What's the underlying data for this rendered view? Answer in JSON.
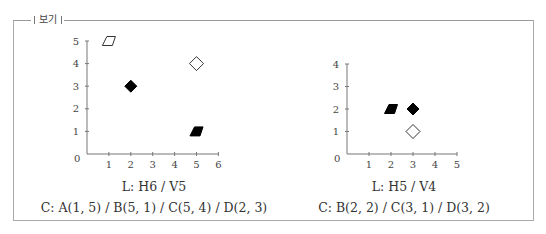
{
  "header": {
    "legend_label": "보기"
  },
  "chart_data": [
    {
      "type": "scatter",
      "title": "",
      "xlabel": "",
      "ylabel": "",
      "xlim": [
        0,
        6
      ],
      "ylim": [
        0,
        5
      ],
      "x_ticks": [
        "1",
        "2",
        "3",
        "4",
        "5",
        "6"
      ],
      "y_ticks": [
        "1",
        "2",
        "3",
        "4",
        "5"
      ],
      "origin_label": "0",
      "grid": false,
      "points": [
        {
          "label": "A",
          "x": 1,
          "y": 5,
          "marker": "parallelogram",
          "fill": "open"
        },
        {
          "label": "B",
          "x": 5,
          "y": 1,
          "marker": "parallelogram",
          "fill": "filled"
        },
        {
          "label": "C",
          "x": 5,
          "y": 4,
          "marker": "diamond",
          "fill": "open"
        },
        {
          "label": "D",
          "x": 2,
          "y": 3,
          "marker": "diamond",
          "fill": "filled"
        }
      ],
      "caption_line1": "L: H6 / V5",
      "caption_line2": "C: A(1, 5) / B(5, 1) / C(5, 4) / D(2, 3)"
    },
    {
      "type": "scatter",
      "title": "",
      "xlabel": "",
      "ylabel": "",
      "xlim": [
        0,
        5
      ],
      "ylim": [
        0,
        4
      ],
      "x_ticks": [
        "1",
        "2",
        "3",
        "4",
        "5"
      ],
      "y_ticks": [
        "1",
        "2",
        "3",
        "4"
      ],
      "origin_label": "0",
      "grid": false,
      "points": [
        {
          "label": "B",
          "x": 2,
          "y": 2,
          "marker": "parallelogram",
          "fill": "filled"
        },
        {
          "label": "C",
          "x": 3,
          "y": 1,
          "marker": "diamond",
          "fill": "open"
        },
        {
          "label": "D",
          "x": 3,
          "y": 2,
          "marker": "diamond",
          "fill": "filled"
        }
      ],
      "caption_line1": "L: H5 / V4",
      "caption_line2": "C: B(2, 2) / C(3, 1) / D(3, 2)"
    }
  ]
}
